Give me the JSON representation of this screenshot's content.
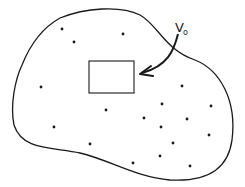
{
  "diagram": {
    "type": "region-with-points",
    "label": {
      "main": "V",
      "sub": "o"
    },
    "colors": {
      "stroke": "#1a1a1a",
      "background": "#ffffff"
    },
    "volume_element": {
      "x": 89,
      "y": 61,
      "width": 45,
      "height": 32
    },
    "points": [
      [
        62,
        29
      ],
      [
        74,
        42
      ],
      [
        123,
        34
      ],
      [
        41,
        87
      ],
      [
        182,
        86
      ],
      [
        162,
        104
      ],
      [
        211,
        106
      ],
      [
        106,
        110
      ],
      [
        144,
        118
      ],
      [
        187,
        119
      ],
      [
        54,
        127
      ],
      [
        161,
        127
      ],
      [
        209,
        135
      ],
      [
        173,
        143
      ],
      [
        90,
        144
      ],
      [
        160,
        156
      ],
      [
        133,
        163
      ],
      [
        190,
        166
      ]
    ]
  }
}
